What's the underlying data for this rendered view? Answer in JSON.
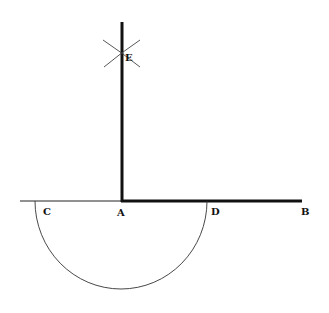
{
  "diagram": {
    "type": "geometric-construction",
    "labels": {
      "A": "A",
      "B": "B",
      "C": "C",
      "D": "D",
      "E": "E"
    },
    "colors": {
      "stroke": "#111111",
      "background": "#ffffff"
    }
  }
}
